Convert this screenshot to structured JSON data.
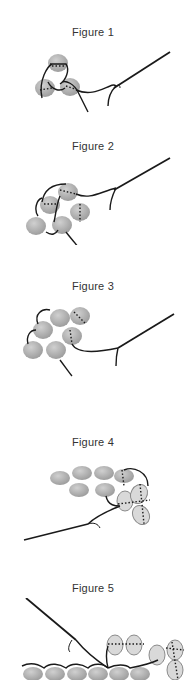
{
  "figures": [
    {
      "caption": "Figure 1"
    },
    {
      "caption": "Figure 2"
    },
    {
      "caption": "Figure 3"
    },
    {
      "caption": "Figure 4"
    },
    {
      "caption": "Figure 5"
    }
  ],
  "colors": {
    "bead_fill": "#b5b5b5",
    "bead_light_fill": "#d9d9d9",
    "bead_stroke": "#8a8a8a",
    "thread": "#1a1a1a",
    "caption": "#333333"
  }
}
